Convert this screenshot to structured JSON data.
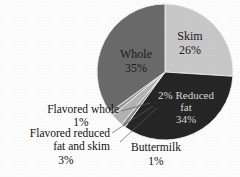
{
  "chart_data": {
    "type": "pie",
    "title": "",
    "subtitle": "",
    "xlabel": "",
    "ylabel": "",
    "legend_position": "none",
    "grid": false,
    "units": "percent",
    "categories": [
      "Skim",
      "2% Reduced fat",
      "Buttermilk",
      "Flavored reduced fat and skim",
      "Flavored whole",
      "Whole"
    ],
    "values": [
      26,
      34,
      1,
      3,
      1,
      35
    ],
    "slices": [
      {
        "name": "Skim",
        "label_line1": "Skim",
        "label_line2": "26%",
        "value": 26,
        "color": "#c9c9c9",
        "label_placement": "inside",
        "label_color": "#1a1a1a",
        "start_angle_deg": 0,
        "end_angle_deg": 93.6
      },
      {
        "name": "2% Reduced fat",
        "label_line1": "2% Reduced",
        "label_line2": "fat",
        "label_line3": "34%",
        "value": 34,
        "color": "#262626",
        "label_placement": "inside",
        "label_color": "#d8d8d8",
        "start_angle_deg": 93.6,
        "end_angle_deg": 216.0
      },
      {
        "name": "Buttermilk",
        "label_line1": "Buttermilk",
        "label_line2": "1%",
        "value": 1,
        "color": "#8d8d8d",
        "label_placement": "callout",
        "label_color": "#111111",
        "start_angle_deg": 216.0,
        "end_angle_deg": 219.6
      },
      {
        "name": "Flavored reduced fat and skim",
        "label_line1": "Flavored reduced",
        "label_line2": "fat and skim",
        "label_line3": "3%",
        "value": 3,
        "color": "#b4b4b4",
        "label_placement": "callout",
        "label_color": "#111111",
        "start_angle_deg": 219.6,
        "end_angle_deg": 230.4
      },
      {
        "name": "Flavored whole",
        "label_line1": "Flavored whole",
        "label_line2": "1%",
        "value": 1,
        "color": "#9a9a9a",
        "label_placement": "callout",
        "label_color": "#111111",
        "start_angle_deg": 230.4,
        "end_angle_deg": 234.0
      },
      {
        "name": "Whole",
        "label_line1": "Whole",
        "label_line2": "35%",
        "value": 35,
        "color": "#6b6b6b",
        "label_placement": "inside",
        "label_color": "#1a1a1a",
        "start_angle_deg": 234.0,
        "end_angle_deg": 360.0
      }
    ],
    "background_color": "#ffffff",
    "slice_border_color": "#f2f2f2"
  }
}
